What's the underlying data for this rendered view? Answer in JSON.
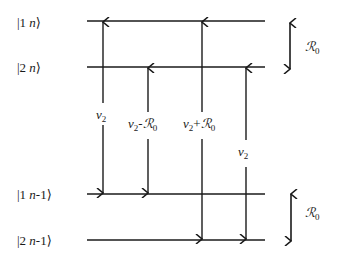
{
  "diagram": {
    "title": "",
    "levels": [
      {
        "id": "l1",
        "label_main": "|1 ",
        "label_n": "n",
        "label_end": "⟩",
        "y": 21
      },
      {
        "id": "l2",
        "label_main": "|2 ",
        "label_n": "n",
        "label_end": "⟩",
        "y": 67
      },
      {
        "id": "l3",
        "label_main": "|1 ",
        "label_n": "n",
        "label_end": "-1⟩",
        "y": 194
      },
      {
        "id": "l4",
        "label_main": "|2 ",
        "label_n": "n",
        "label_end": "-1⟩",
        "y": 240
      }
    ],
    "transitions": [
      {
        "id": "t1",
        "label_base": "ν",
        "label_sub": "2",
        "label_op": "",
        "label_r": "",
        "label_r_sub": "",
        "from": "l3",
        "to": "l1",
        "x": 103
      },
      {
        "id": "t2",
        "label_base": "ν",
        "label_sub": "2",
        "label_op": "-",
        "label_r": "ℛ",
        "label_r_sub": "0",
        "from": "l3",
        "to": "l2",
        "x": 148
      },
      {
        "id": "t3",
        "label_base": "ν",
        "label_sub": "2",
        "label_op": "+",
        "label_r": "ℛ",
        "label_r_sub": "0",
        "from": "l4",
        "to": "l1",
        "x": 202
      },
      {
        "id": "t4",
        "label_base": "ν",
        "label_sub": "2",
        "label_op": "",
        "label_r": "",
        "label_r_sub": "",
        "from": "l4",
        "to": "l2",
        "x": 246
      }
    ],
    "splittings": [
      {
        "id": "s1",
        "label_r": "ℛ",
        "label_sub": "0",
        "between": [
          "l1",
          "l2"
        ]
      },
      {
        "id": "s2",
        "label_r": "ℛ",
        "label_sub": "0",
        "between": [
          "l3",
          "l4"
        ]
      }
    ],
    "colors": {
      "line": "#1a1a1a",
      "background": "#ffffff"
    }
  }
}
